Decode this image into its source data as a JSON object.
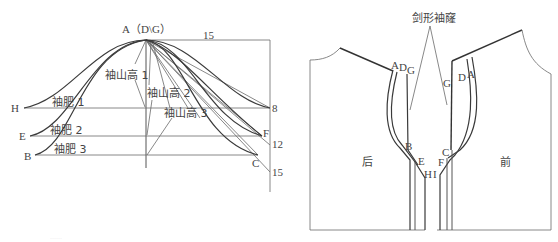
{
  "left_diagram": {
    "apex_label": "A（D\\G）",
    "top_width_label": "15",
    "right_scale_labels": [
      "8",
      "12",
      "15"
    ],
    "point_labels": {
      "H": "H",
      "E": "E",
      "B": "B",
      "F": "F",
      "C": "C"
    },
    "sleeve_cap_heights": [
      "袖山高 1",
      "袖山高 2",
      "袖山高 3"
    ],
    "sleeve_widths": [
      "袖肥 1",
      "袖肥 2",
      "袖肥 3"
    ]
  },
  "right_diagram": {
    "title_callout": "剑形袖窿",
    "back_label": "后",
    "front_label": "前",
    "back_points": [
      "A",
      "D",
      "G",
      "B",
      "E",
      "H"
    ],
    "front_points": [
      "G",
      "D",
      "A",
      "C",
      "F",
      "I"
    ]
  },
  "caption_faint": "······"
}
